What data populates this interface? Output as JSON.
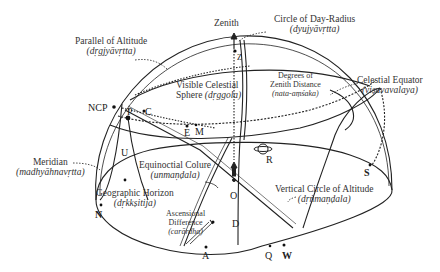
{
  "labels": {
    "zenith": "Zenith",
    "parallel_of_altitude": {
      "en": "Parallel of Altitude",
      "skt": "(dṛgjyāvṛtta)"
    },
    "circle_of_day_radius": {
      "en": "Circle of Day-Radius",
      "skt": "(dyujyāvṛtta)"
    },
    "visible_celestial_sphere": {
      "en1": "Visible Celestial",
      "en2": "Sphere",
      "skt": "(dṛggola)"
    },
    "degrees_of_zenith_distance": {
      "en1": "Degrees of",
      "en2": "Zenith Distance",
      "skt": "(nata-aṃśaka)"
    },
    "celestial_equator": {
      "en": "Celestial Equator",
      "skt": "(viṣuvavalaya)"
    },
    "meridian": {
      "en": "Meridian",
      "skt": "(madhyāhnavṛtta)"
    },
    "equinoctial_colure": {
      "en": "Equinoctial Colure",
      "skt": "(unmaṇḍala)"
    },
    "geographic_horizon": {
      "en": "Geographic Horizon",
      "skt": "(dṛkkṣitija)"
    },
    "ascensional_difference": {
      "en1": "Ascensional",
      "en2": "Difference",
      "skt": "(carārdha)"
    },
    "vertical_circle_of_altitude": {
      "en": "Vertical Circle of Altitude",
      "skt": "(dṛṅmaṇḍala)"
    }
  },
  "points": {
    "ncp": "NCP",
    "p": "P",
    "c": "C",
    "e": "E",
    "m": "M",
    "z": "Z",
    "u": "U",
    "r": "R",
    "o": "O",
    "d": "D",
    "a": "A",
    "q": "Q",
    "w": "W",
    "n": "N",
    "s": "S"
  },
  "colors": {
    "line": "#222222",
    "text": "#333333",
    "background": "#ffffff"
  }
}
